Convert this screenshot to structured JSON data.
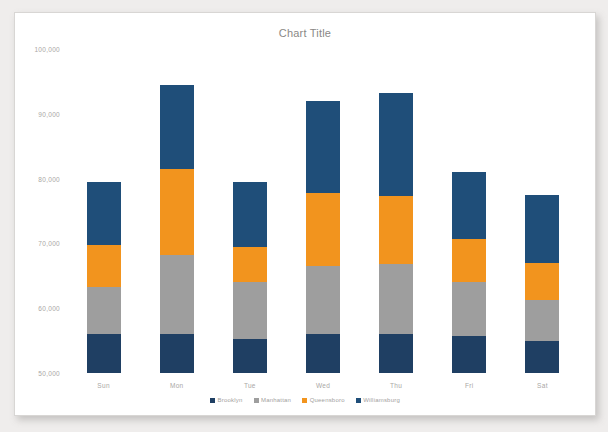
{
  "document": {
    "background_color": "#efedec",
    "sheet_color": "#ffffff"
  },
  "chart_data": {
    "type": "bar",
    "stacked": true,
    "title": "Chart Title",
    "xlabel": "",
    "ylabel": "",
    "ylim": [
      0,
      100000
    ],
    "ytick_step": 10000,
    "grid": false,
    "legend_position": "bottom",
    "categories": [
      "Sun",
      "Mon",
      "Tue",
      "Wed",
      "Thu",
      "Fri",
      "Sat"
    ],
    "ytick_labels": [
      "10,000",
      "20,000",
      "30,000",
      "40,000",
      "50,000",
      "60,000",
      "70,000",
      "80,000",
      "90,000",
      "100,000"
    ],
    "ytick_values": [
      10000,
      20000,
      30000,
      40000,
      50000,
      60000,
      70000,
      80000,
      90000,
      100000
    ],
    "series": [
      {
        "name": "Brooklyn",
        "color": "#1F3F63",
        "values": [
          12000,
          12000,
          10500,
          12000,
          12000,
          11500,
          10000
        ]
      },
      {
        "name": "Manhattan",
        "color": "#9E9E9E",
        "values": [
          14500,
          24500,
          17500,
          21000,
          21500,
          16500,
          12500
        ]
      },
      {
        "name": "Queensboro",
        "color": "#F2941E",
        "values": [
          13000,
          26500,
          11000,
          22500,
          21000,
          13500,
          11500
        ]
      },
      {
        "name": "Williamsburg",
        "color": "#1F4E79",
        "values": [
          19500,
          26000,
          20000,
          28500,
          32000,
          20500,
          21000
        ]
      }
    ],
    "totals": [
      59000,
      89000,
      59000,
      84000,
      86500,
      62000,
      55000
    ]
  },
  "legend": {
    "items": [
      {
        "label": "Brooklyn",
        "color": "#1F3F63"
      },
      {
        "label": "Manhattan",
        "color": "#9E9E9E"
      },
      {
        "label": "Queensboro",
        "color": "#F2941E"
      },
      {
        "label": "Williamsburg",
        "color": "#1F4E79"
      }
    ]
  }
}
